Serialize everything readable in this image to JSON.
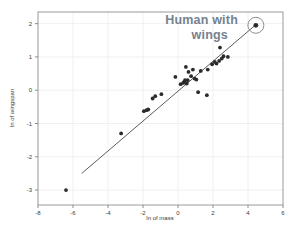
{
  "chart_data": {
    "type": "scatter",
    "title": "",
    "xlabel": "ln of mass",
    "ylabel": "ln of wingspan",
    "xlim": [
      -8,
      6
    ],
    "ylim": [
      -3.45,
      2.35
    ],
    "xticks": [
      -8,
      -6,
      -4,
      -2,
      0,
      2,
      4,
      6
    ],
    "xtick_labels": [
      "-8",
      "-6",
      "-4",
      "-2",
      "0",
      "2",
      "4",
      "6"
    ],
    "yticks": [
      -3,
      -2,
      -1,
      0,
      1,
      2
    ],
    "ytick_labels": [
      "-3",
      "-2",
      "-1",
      "0",
      "1",
      "2"
    ],
    "grid": true,
    "legend": "none",
    "marker_color": "#2b2b2b",
    "line_color": "#4a4a4a",
    "points": [
      [
        -6.4,
        -3.0
      ],
      [
        -3.25,
        -1.3
      ],
      [
        -1.95,
        -0.63
      ],
      [
        -1.8,
        -0.6
      ],
      [
        -1.7,
        -0.58
      ],
      [
        -1.45,
        -0.25
      ],
      [
        -1.3,
        -0.18
      ],
      [
        -0.95,
        -0.12
      ],
      [
        -0.15,
        0.4
      ],
      [
        0.15,
        0.18
      ],
      [
        0.3,
        0.22
      ],
      [
        0.35,
        0.25
      ],
      [
        0.4,
        0.3
      ],
      [
        0.45,
        0.7
      ],
      [
        0.5,
        0.2
      ],
      [
        0.55,
        0.3
      ],
      [
        0.6,
        0.55
      ],
      [
        0.75,
        0.42
      ],
      [
        0.85,
        0.62
      ],
      [
        0.95,
        0.35
      ],
      [
        1.05,
        0.32
      ],
      [
        1.15,
        -0.06
      ],
      [
        1.3,
        0.58
      ],
      [
        1.65,
        -0.15
      ],
      [
        1.7,
        0.62
      ],
      [
        1.95,
        0.78
      ],
      [
        2.1,
        0.85
      ],
      [
        2.2,
        0.8
      ],
      [
        2.35,
        0.88
      ],
      [
        2.4,
        1.28
      ],
      [
        2.5,
        0.95
      ],
      [
        2.6,
        1.02
      ],
      [
        2.85,
        1.0
      ]
    ],
    "trendline": {
      "x_start": -5.5,
      "y_start": -2.5,
      "x_end": 4.45,
      "y_end": 1.97
    },
    "highlight": {
      "label": "Human with wings",
      "label_line_1": "Human with",
      "label_line_2": "wings",
      "point": [
        4.45,
        1.95
      ],
      "circle_radius_px": 8,
      "text_color": "#76818f"
    }
  }
}
